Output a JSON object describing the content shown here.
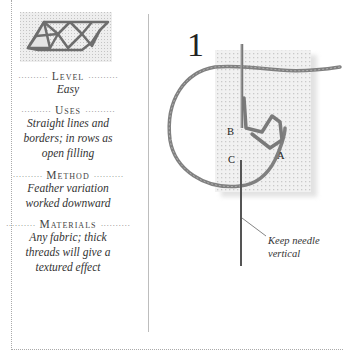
{
  "sidebar": {
    "sections": [
      {
        "heading": "Level",
        "body": "Easy"
      },
      {
        "heading": "Uses",
        "body": "Straight lines and borders; in rows as open filling"
      },
      {
        "heading": "Method",
        "body": "Feather variation worked downward"
      },
      {
        "heading": "Materials",
        "body": "Any fabric; thick threads will give a textured effect"
      }
    ],
    "dots_left": "··········",
    "dots_right": "··········"
  },
  "illustration": {
    "step_number": "1",
    "labels": {
      "a": "A",
      "b": "B",
      "c": "C"
    },
    "callout_line1": "Keep needle",
    "callout_line2": "vertical"
  },
  "colors": {
    "thread": "#7a7a7a",
    "fabric": "#ececec",
    "needle": "#555555"
  }
}
